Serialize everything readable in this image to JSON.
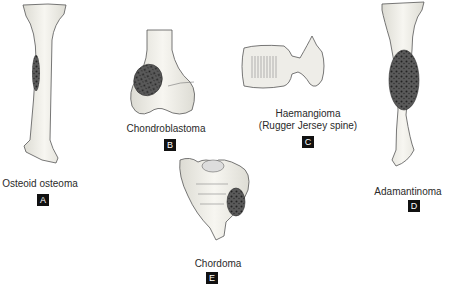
{
  "figures": [
    {
      "id": "A",
      "caption": "Osteoid osteoma",
      "letter": "A"
    },
    {
      "id": "B",
      "caption": "Chondroblastoma",
      "letter": "B"
    },
    {
      "id": "C",
      "caption_line1": "Haemangioma",
      "caption_line2": "(Rugger Jersey spine)",
      "letter": "C"
    },
    {
      "id": "D",
      "caption": "Adamantinoma",
      "letter": "D"
    },
    {
      "id": "E",
      "caption": "Chordoma",
      "letter": "E"
    }
  ],
  "colors": {
    "bone": "#f1f0ea",
    "outline": "#555555",
    "tumor": "#4a4a4a",
    "label_bg": "#111111"
  }
}
